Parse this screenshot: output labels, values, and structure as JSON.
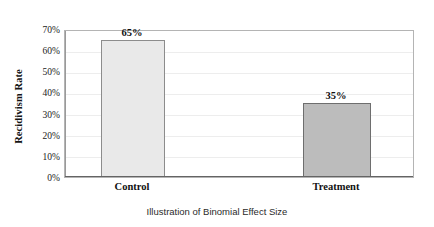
{
  "chart_data": {
    "type": "bar",
    "title": "",
    "subtitle": "",
    "caption": "Illustration of Binomial Effect Size",
    "categories": [
      "Control",
      "Treatment"
    ],
    "values": [
      65,
      35
    ],
    "value_labels": [
      "65%",
      "35%"
    ],
    "xlabel": "",
    "ylabel": "Recidivism Rate",
    "ylim": [
      0,
      70
    ],
    "ytick_values": [
      0,
      10,
      20,
      30,
      40,
      50,
      60,
      70
    ],
    "ytick_labels": [
      "0%",
      "10%",
      "20%",
      "30%",
      "40%",
      "50%",
      "60%",
      "70%"
    ],
    "grid": true,
    "grid_orientation": "horizontal",
    "legend": false,
    "legend_position": "none",
    "series": [
      {
        "name": "Recidivism Rate",
        "values": [
          65,
          35
        ],
        "colors": [
          "#e9e9e9",
          "#bcbcbc"
        ]
      }
    ],
    "bar_colors": {
      "control": "#e9e9e9",
      "treatment": "#bcbcbc",
      "control_border": "#8c8c8c",
      "treatment_border": "#6e6e6e"
    },
    "plot_border_color": "#b4b4b4",
    "gridline_color": "#ededed",
    "axis_color": "#646464",
    "text_color": "#111111"
  }
}
